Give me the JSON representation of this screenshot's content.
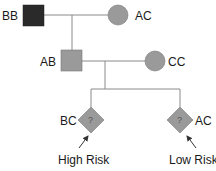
{
  "diagram": {
    "type": "pedigree",
    "colors": {
      "affected": "#2a2a2a",
      "carrier": "#9a9a9a",
      "line": "#8a8a8a",
      "arrow": "#333333"
    },
    "generation1": {
      "father": {
        "shape": "square",
        "genotype": "BB",
        "affected": true
      },
      "mother": {
        "shape": "circle",
        "genotype": "AC"
      }
    },
    "generation2": {
      "son": {
        "shape": "square",
        "genotype": "AB"
      },
      "partner": {
        "shape": "circle",
        "genotype": "CC"
      }
    },
    "generation3": [
      {
        "shape": "diamond",
        "genotype": "BC",
        "symbol": "?",
        "annotation": "High Risk"
      },
      {
        "shape": "diamond",
        "genotype": "AC",
        "symbol": "?",
        "annotation": "Low Risk"
      }
    ]
  }
}
